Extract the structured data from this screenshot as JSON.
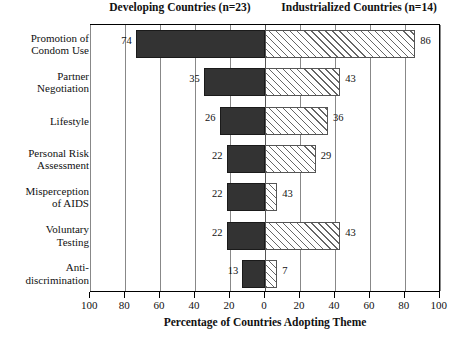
{
  "headers": {
    "left_group": "Developing Countries (n=23)",
    "right_group": "Industrialized Countries (n=14)"
  },
  "axis": {
    "title": "Percentage of Countries Adopting Theme",
    "tick_labels": [
      "100",
      "80",
      "60",
      "40",
      "20",
      "0",
      "20",
      "40",
      "60",
      "80",
      "100"
    ]
  },
  "chart_data": {
    "type": "bar",
    "title": "",
    "subtitle": "",
    "orientation": "horizontal-diverging",
    "xlabel": "Percentage of Countries Adopting Theme",
    "ylabel": "",
    "xlim": [
      -100,
      100
    ],
    "xticks": [
      -100,
      -80,
      -60,
      -40,
      -20,
      0,
      20,
      40,
      60,
      80,
      100
    ],
    "xtick_labels": [
      "100",
      "80",
      "60",
      "40",
      "20",
      "0",
      "20",
      "40",
      "60",
      "80",
      "100"
    ],
    "grid": true,
    "legend_position": "top",
    "categories": [
      "Promotion of\nCondom Use",
      "Partner\nNegotiation",
      "Lifestyle",
      "Personal Risk\nAssessment",
      "Misperception\nof AIDS",
      "Voluntary\nTesting",
      "Anti-\ndiscrimination"
    ],
    "series": [
      {
        "name": "Developing Countries (n=23)",
        "direction": "left",
        "fill": "solid-dark",
        "values": [
          74,
          35,
          26,
          22,
          22,
          22,
          13
        ],
        "drawn_values": [
          74,
          35,
          26,
          22,
          22,
          22,
          13
        ]
      },
      {
        "name": "Industrialized Countries (n=14)",
        "direction": "right",
        "fill": "diagonal-hatch",
        "values": [
          86,
          43,
          36,
          29,
          43,
          43,
          7
        ],
        "drawn_values": [
          86,
          43,
          36,
          29,
          7,
          43,
          7
        ]
      }
    ]
  },
  "colors": {
    "left_bar": "#333333",
    "right_bar_line": "#666666",
    "frame": "#000000",
    "grid": "#888888",
    "background": "#ffffff"
  }
}
